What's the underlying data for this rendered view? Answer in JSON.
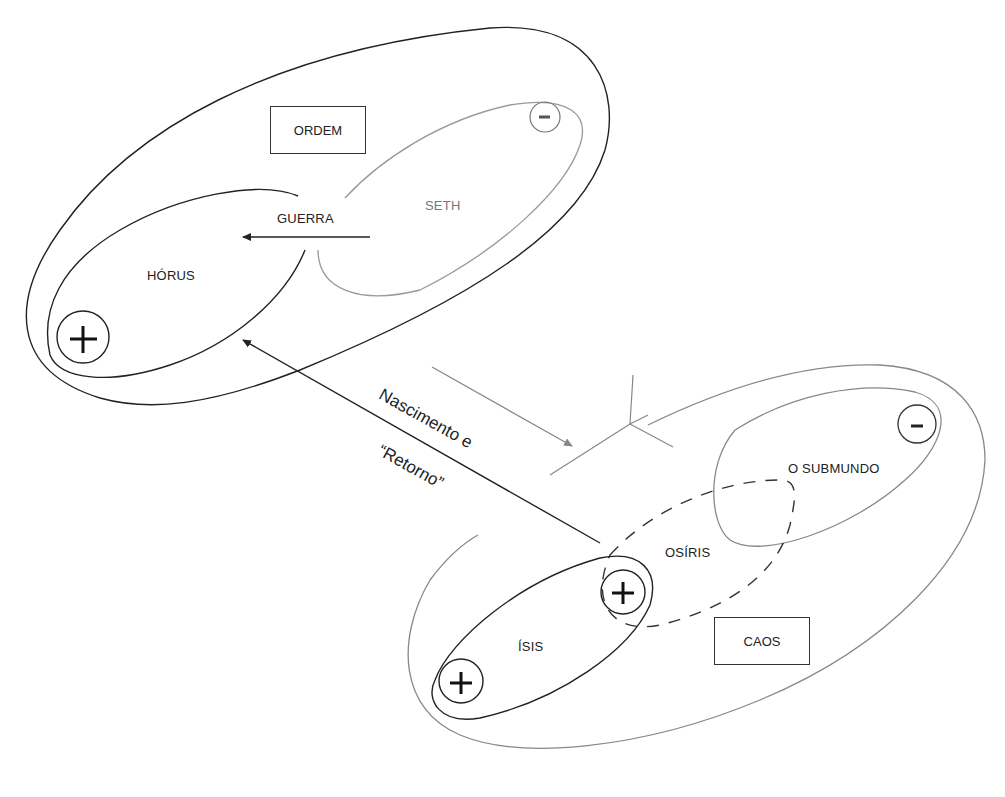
{
  "diagram": {
    "upper_group": {
      "label": "ORDEM",
      "horus": {
        "label": "HÓRUS",
        "sign": "+"
      },
      "seth": {
        "label": "SETH",
        "sign": "-"
      },
      "war_arrow_label": "GUERRA"
    },
    "lower_group": {
      "label": "CAOS",
      "isis": {
        "label": "ÍSIS",
        "signs": [
          "+",
          "+"
        ]
      },
      "osiris": {
        "label": "OSÍRIS"
      },
      "underworld": {
        "label": "O SUBMUNDO",
        "sign": "-"
      }
    },
    "birth_arrow": {
      "line1": "Nascimento e",
      "line2": "“Retorno”"
    },
    "colors": {
      "order_stroke": "#222222",
      "chaos_stroke": "#888888",
      "seth_stroke": "#999999"
    }
  }
}
